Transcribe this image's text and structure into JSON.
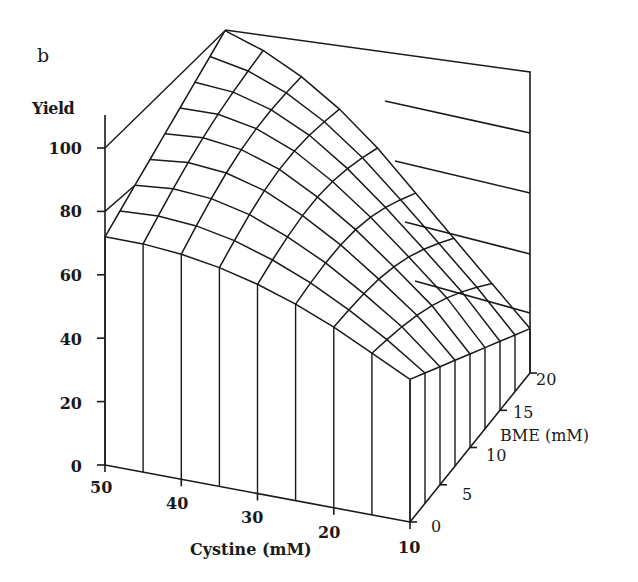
{
  "panel_label": "b",
  "chart_data": {
    "type": "surface3d",
    "title": "",
    "panel": "b",
    "zlabel": "Yield",
    "xlabel": "Cystine (mM)",
    "ylabel": "BME (mM)",
    "zlim": [
      0,
      110
    ],
    "xlim": [
      50,
      10
    ],
    "ylim": [
      0,
      20
    ],
    "z_ticks": [
      0,
      20,
      40,
      60,
      80,
      100
    ],
    "x_ticks": [
      50,
      40,
      30,
      20,
      10
    ],
    "y_ticks": [
      0,
      5,
      10,
      15,
      20
    ],
    "grid": true,
    "cystine_values": [
      50,
      45,
      40,
      35,
      30,
      25,
      20,
      15,
      10
    ],
    "bme_values": [
      0,
      2.5,
      5,
      7.5,
      10,
      12.5,
      15,
      17.5,
      20
    ],
    "yield_at_bme_0": [
      72,
      72,
      71,
      69,
      66,
      62,
      57,
      51,
      45
    ],
    "yield_at_bme_20": [
      90,
      86,
      80,
      72,
      62,
      50,
      38,
      26,
      14
    ],
    "curvature": [
      0,
      3,
      5,
      6,
      6,
      6,
      5,
      4,
      0
    ]
  },
  "axes": {
    "z_ticks": [
      {
        "label": "0",
        "top": 457
      },
      {
        "label": "20",
        "top": 394
      },
      {
        "label": "40",
        "top": 330
      },
      {
        "label": "60",
        "top": 266
      },
      {
        "label": "80",
        "top": 202
      },
      {
        "label": "100",
        "top": 139
      }
    ],
    "x_ticks": [
      {
        "label": "50",
        "left": 90,
        "top": 478
      },
      {
        "label": "40",
        "left": 166,
        "top": 494
      },
      {
        "label": "30",
        "left": 241,
        "top": 508
      },
      {
        "label": "20",
        "left": 318,
        "top": 523
      },
      {
        "label": "10",
        "left": 398,
        "top": 538
      }
    ],
    "y_ticks": [
      {
        "label": "0",
        "left": 431,
        "top": 517
      },
      {
        "label": "5",
        "left": 462,
        "top": 485
      },
      {
        "label": "10",
        "left": 486,
        "top": 446
      },
      {
        "label": "15",
        "left": 513,
        "top": 403
      },
      {
        "label": "20",
        "left": 536,
        "top": 370
      }
    ]
  }
}
